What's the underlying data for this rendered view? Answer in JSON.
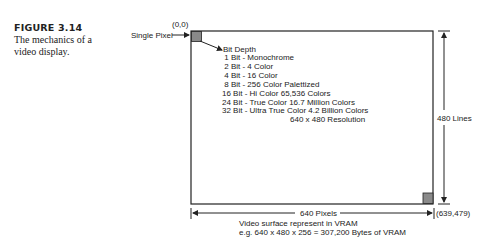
{
  "figure": {
    "number": "FIGURE 3.14",
    "caption": "The mechanics of a video display."
  },
  "diagram": {
    "origin_label": "(0,0)",
    "single_pixel_label": "Single Pixel",
    "bit_depth_title": "Bit Depth",
    "bit_depths": [
      {
        "bits": " 1 Bit -",
        "desc": "Monochrome"
      },
      {
        "bits": " 2 Bit -",
        "desc": "4 Color"
      },
      {
        "bits": " 4 Bit -",
        "desc": "16 Color"
      },
      {
        "bits": " 8 Bit -",
        "desc": "256 Color Palettized"
      },
      {
        "bits": "16 Bit -",
        "desc": "Hi Color 65,536 Colors"
      },
      {
        "bits": "24 Bit -",
        "desc": "True Color 16.7 Million Colors"
      },
      {
        "bits": "32 Bit -",
        "desc": "Ultra True Color 4.2 Billion Colors"
      }
    ],
    "resolution_label": "640 x 480 Resolution",
    "height_label": "480 Lines",
    "width_label": "640 Pixels",
    "end_coord_label": "(639,479)",
    "vram_line1": "Video surface represent in VRAM",
    "vram_line2": "e.g. 640 x 480 x 256 = 307,200 Bytes of VRAM",
    "colors": {
      "line": "#222222",
      "pixel_fill": "#8a8a8a"
    }
  }
}
